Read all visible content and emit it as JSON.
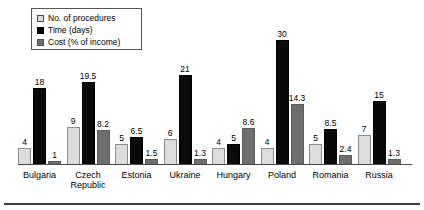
{
  "legend": {
    "items": [
      {
        "label": "No. of procedures",
        "swatch": "light-gray-square",
        "color": "#dcdcdc"
      },
      {
        "label": "Time (days)",
        "swatch": "black-square",
        "color": "#000000"
      },
      {
        "label": "Cost (% of income)",
        "swatch": "dark-gray-square",
        "color": "#6e6e6e"
      }
    ]
  },
  "chart_data": {
    "type": "bar",
    "title": "",
    "xlabel": "",
    "ylabel": "",
    "grid": false,
    "legend_position": "top-left",
    "axis_visible": {
      "x_baseline": true,
      "y_axis": false
    },
    "ylim": [
      0,
      30
    ],
    "categories": [
      "Bulgaria",
      "Czech\nRepublic",
      "Estonia",
      "Ukraine",
      "Hungary",
      "Poland",
      "Romania",
      "Russia"
    ],
    "series": [
      {
        "name": "No. of procedures",
        "color": "#dcdcdc",
        "values": [
          4,
          9,
          5,
          6,
          4,
          4,
          5,
          7
        ]
      },
      {
        "name": "Time (days)",
        "color": "#000000",
        "values": [
          18,
          19.5,
          6.5,
          21,
          5,
          30,
          8.5,
          15
        ]
      },
      {
        "name": "Cost (% of income)",
        "color": "#6e6e6e",
        "values": [
          1,
          8.2,
          1.5,
          1.3,
          8.6,
          14.3,
          2.4,
          1.3
        ]
      }
    ],
    "data_labels": [
      [
        "4",
        "18",
        "1"
      ],
      [
        "9",
        "19.5",
        "8.2"
      ],
      [
        "5",
        "6.5",
        "1.5"
      ],
      [
        "6",
        "21",
        "1.3"
      ],
      [
        "4",
        "5",
        "8.6"
      ],
      [
        "4",
        "30",
        "14.3"
      ],
      [
        "5",
        "8.5",
        "2.4"
      ],
      [
        "7",
        "15",
        "1.3"
      ]
    ]
  }
}
